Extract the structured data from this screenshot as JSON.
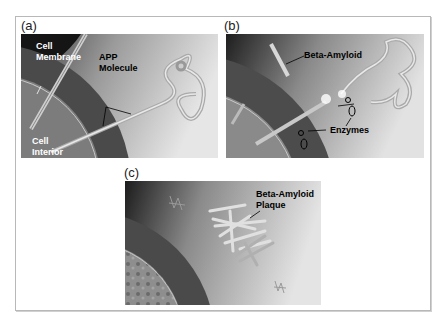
{
  "figure": {
    "panels": [
      {
        "id": "a",
        "label": "(a)",
        "annotations": {
          "cell_membrane_line1": "Cell",
          "cell_membrane_line2": "Membrane",
          "app_line1": "APP",
          "app_line2": "Molecule",
          "interior_line1": "Cell",
          "interior_line2": "Interior"
        }
      },
      {
        "id": "b",
        "label": "(b)",
        "annotations": {
          "beta_amyloid": "Beta-Amyloid",
          "enzymes": "Enzymes"
        }
      },
      {
        "id": "c",
        "label": "(c)",
        "annotations": {
          "plaque_line1": "Beta-Amyloid",
          "plaque_line2": "Plaque"
        }
      }
    ],
    "colors": {
      "frame_border": "#b8b8b8",
      "background_dark": "#1e1e1e",
      "membrane_band": "#4a4a4a",
      "interior": "#8a8a8a",
      "extracellular": "#d8d8d8"
    }
  }
}
